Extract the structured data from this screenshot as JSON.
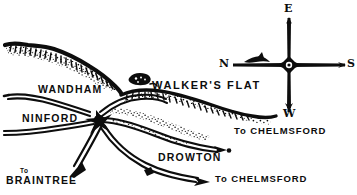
{
  "figure": {
    "kind": "hand-drawn-sketch-map",
    "ink_color": "#0d0d0d",
    "paper_color": "#ffffff"
  },
  "places": {
    "wandham": "WANDHAM",
    "ninford": "NINFORD",
    "walkers_flat": "WALKER'S FLAT",
    "drowton": "DROWTON"
  },
  "road_labels": {
    "to_chelmsford_upper": "To CHELMSFORD",
    "to_chelmsford_lower": "To CHELMSFORD",
    "to_braintree_prefix": "To",
    "to_braintree_place": "BRAINTREE"
  },
  "compass": {
    "top": "E",
    "left": "N",
    "right": "S",
    "bottom": "W"
  }
}
